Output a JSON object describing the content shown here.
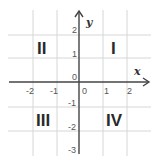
{
  "diagram": {
    "axes": {
      "x_label": "x",
      "y_label": "y",
      "x_ticks": [
        "-2",
        "-1",
        "0",
        "1",
        "2"
      ],
      "y_ticks": [
        "2",
        "1",
        "0",
        "-1",
        "-2",
        "-3"
      ],
      "origin_label": "0"
    },
    "quadrants": {
      "q1": "I",
      "q2": "II",
      "q3": "III",
      "q4": "IV"
    },
    "colors": {
      "axis": "#444444",
      "grid": "#d4d4d4",
      "text": "#2a2a2a"
    }
  }
}
